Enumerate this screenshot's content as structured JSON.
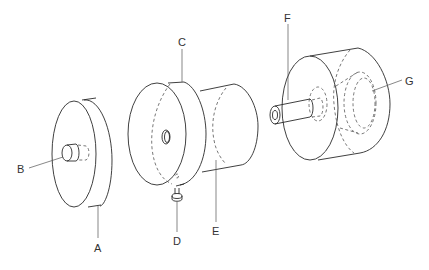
{
  "diagram": {
    "labels": {
      "A": "A",
      "B": "B",
      "C": "C",
      "D": "D",
      "E": "E",
      "F": "F",
      "G": "G"
    },
    "parts": [
      {
        "id": "A",
        "name": "left disc"
      },
      {
        "id": "B",
        "name": "hub on left disc"
      },
      {
        "id": "C",
        "name": "middle disc flange"
      },
      {
        "id": "D",
        "name": "thumb screw"
      },
      {
        "id": "E",
        "name": "middle cylinder body"
      },
      {
        "id": "F",
        "name": "shaft"
      },
      {
        "id": "G",
        "name": "internal stepped bore"
      }
    ],
    "line_color": "#2a2a2a",
    "background": "#ffffff"
  }
}
